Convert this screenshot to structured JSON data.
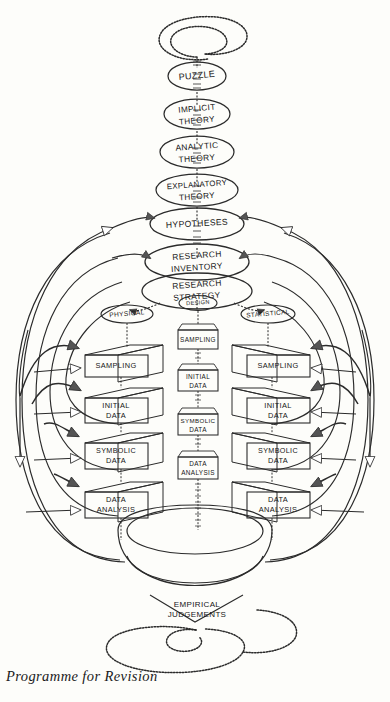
{
  "figure": {
    "title_caption": "Programme for Revision",
    "background_color": "#fdfdfa",
    "ink_color": "#2b2b2b",
    "style": "hand-drawn pen-and-ink flow diagram, grayscale"
  },
  "spiral_top": {
    "name": "top-spiral",
    "label": ""
  },
  "spiral_bottom": {
    "name": "bottom-spiral",
    "label": ""
  },
  "chain": {
    "label": "central conceptual chain",
    "nodes": [
      {
        "id": "puzzle",
        "label": "PUZZLE",
        "shape": "ellipse"
      },
      {
        "id": "implicit-theory",
        "label": "IMPLICIT THEORY",
        "line1": "IMPLICIT",
        "line2": "THEORY",
        "shape": "ellipse"
      },
      {
        "id": "analytic-theory",
        "label": "ANALYTIC THEORY",
        "line1": "ANALYTIC",
        "line2": "THEORY",
        "shape": "ellipse"
      },
      {
        "id": "explanatory-theory",
        "label": "EXPLANATORY THEORY",
        "line1": "EXPLANATORY",
        "line2": "THEORY",
        "shape": "ellipse"
      },
      {
        "id": "hypotheses",
        "label": "HYPOTHESES",
        "shape": "ellipse"
      },
      {
        "id": "research-inventory",
        "label": "RESEARCH INVENTORY",
        "line1": "RESEARCH",
        "line2": "INVENTORY",
        "shape": "ellipse"
      },
      {
        "id": "research-strategy",
        "label": "RESEARCH STRATEGY",
        "line1": "RESEARCH",
        "line2": "STRATEGY",
        "shape": "ellipse"
      }
    ]
  },
  "branches": [
    {
      "id": "physical",
      "label": "PHYSICAL",
      "column": "left"
    },
    {
      "id": "design",
      "label": "DESIGN",
      "column": "centre"
    },
    {
      "id": "statistical",
      "label": "STATISTICAL",
      "column": "right"
    }
  ],
  "columns": {
    "left": {
      "name": "physical-column",
      "boxes": [
        {
          "id": "l-sampling",
          "label": "SAMPLING",
          "line1": "SAMPLING",
          "line2": ""
        },
        {
          "id": "l-initial-data",
          "label": "INITIAL DATA",
          "line1": "INITIAL",
          "line2": "DATA"
        },
        {
          "id": "l-symbolic-data",
          "label": "SYMBOLIC DATA",
          "line1": "SYMBOLIC",
          "line2": "DATA"
        },
        {
          "id": "l-data-analysis",
          "label": "DATA ANALYSIS",
          "line1": "DATA",
          "line2": "ANALYSIS"
        }
      ]
    },
    "centre": {
      "name": "design-column",
      "boxes": [
        {
          "id": "c-sampling",
          "label": "SAMPLING",
          "line1": "SAMPLING",
          "line2": ""
        },
        {
          "id": "c-initial-data",
          "label": "INITIAL DATA",
          "line1": "INITIAL",
          "line2": "DATA"
        },
        {
          "id": "c-symbolic-data",
          "label": "SYMBOLIC DATA",
          "line1": "SYMBOLIC",
          "line2": "DATA"
        },
        {
          "id": "c-data-analysis",
          "label": "DATA ANALYSIS",
          "line1": "DATA",
          "line2": "ANALYSIS"
        }
      ]
    },
    "right": {
      "name": "statistical-column",
      "boxes": [
        {
          "id": "r-sampling",
          "label": "SAMPLING",
          "line1": "SAMPLING",
          "line2": ""
        },
        {
          "id": "r-initial-data",
          "label": "INITIAL DATA",
          "line1": "INITIAL",
          "line2": "DATA"
        },
        {
          "id": "r-symbolic-data",
          "label": "SYMBOLIC DATA",
          "line1": "SYMBOLIC",
          "line2": "DATA"
        },
        {
          "id": "r-data-analysis",
          "label": "DATA ANALYSIS",
          "line1": "DATA",
          "line2": "ANALYSIS"
        }
      ]
    }
  },
  "bowl": {
    "name": "empirical-judgements-bowl",
    "line1": "EMPIRICAL",
    "line2": "JUDGEMENTS",
    "label": "EMPIRICAL JUDGEMENTS"
  }
}
